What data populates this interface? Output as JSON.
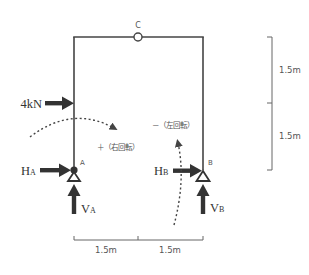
{
  "diagram": {
    "type": "three-hinged frame statics diagram",
    "colors": {
      "frame": "#444444",
      "arrow": "#333333",
      "dimension": "#666666",
      "text": "#333333",
      "dashed": "#444444"
    },
    "nodes": {
      "A": {
        "label": "A"
      },
      "B": {
        "label": "B"
      },
      "C": {
        "label": "C"
      }
    },
    "loads": {
      "applied": {
        "label": "4kN"
      },
      "HA": {
        "main": "H",
        "sub": "A"
      },
      "VA": {
        "main": "V",
        "sub": "A"
      },
      "HB": {
        "main": "H",
        "sub": "B"
      },
      "VB": {
        "main": "V",
        "sub": "B"
      }
    },
    "moments": {
      "clockwise": {
        "label": "＋（右回転）"
      },
      "counterclockwise": {
        "label": "－（左回転）"
      }
    },
    "dimensions": {
      "vertical": [
        {
          "label": "1.5m"
        },
        {
          "label": "1.5m"
        }
      ],
      "horizontal": [
        {
          "label": "1.5m"
        },
        {
          "label": "1.5m"
        }
      ]
    }
  }
}
